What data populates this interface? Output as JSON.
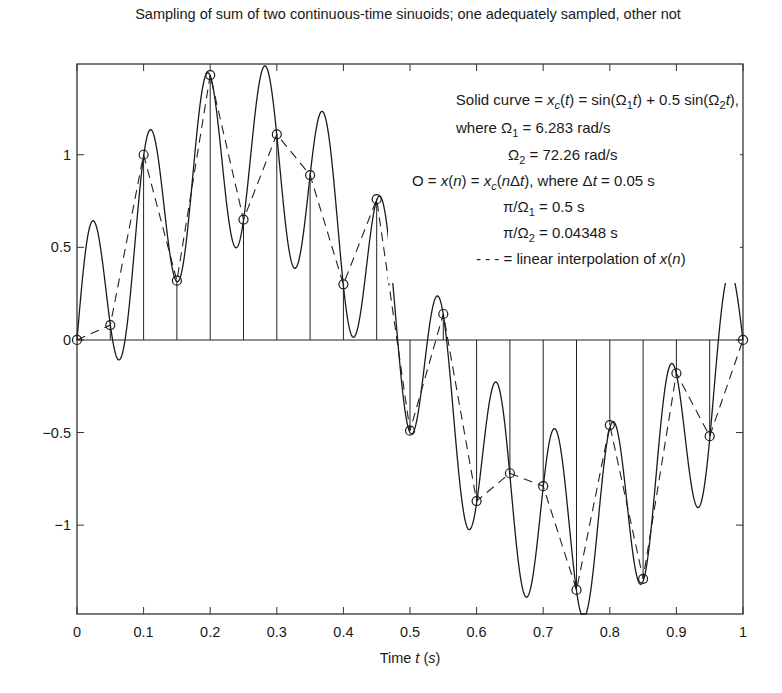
{
  "chart_data": {
    "type": "line",
    "title": "Sampling of sum of two continuous-time sinuoids; one adequately sampled, other not",
    "xlabel": "Time t (s)",
    "xlabel_parts": {
      "pre": "Time ",
      "var": "t",
      "paren_open": " (",
      "unit": "s",
      "paren_close": ")"
    },
    "ylabel": "",
    "xlim": [
      0,
      1
    ],
    "ylim": [
      -1.48,
      1.49
    ],
    "grid": false,
    "x_ticks": [
      0,
      0.1,
      0.2,
      0.3,
      0.4,
      0.5,
      0.6,
      0.7,
      0.8,
      0.9,
      1
    ],
    "x_tick_labels": [
      "0",
      "0.1",
      "0.2",
      "0.3",
      "0.4",
      "0.5",
      "0.6",
      "0.7",
      "0.8",
      "0.9",
      "1"
    ],
    "y_ticks": [
      -1,
      -0.5,
      0,
      0.5,
      1
    ],
    "y_tick_labels": [
      "−1",
      "−0.5",
      "0",
      "0.5",
      "1"
    ],
    "parameters": {
      "Omega1": 6.283,
      "Omega2": 72.26,
      "amplitude2": 0.5,
      "delta_t": 0.05
    },
    "series": [
      {
        "name": "Solid curve x_c(t) = sin(Ω1 t) + 0.5 sin(Ω2 t)",
        "style": "solid",
        "kind": "continuous"
      },
      {
        "name": "Samples x(n) = x_c(nΔt)",
        "style": "circle-markers-with-stems",
        "x": [
          0,
          0.05,
          0.1,
          0.15,
          0.2,
          0.25,
          0.3,
          0.35,
          0.4,
          0.45,
          0.5,
          0.55,
          0.6,
          0.65,
          0.7,
          0.75,
          0.8,
          0.85,
          0.9,
          0.95,
          1.0
        ],
        "values": [
          0.0,
          0.08,
          1.0,
          0.32,
          1.43,
          0.65,
          1.11,
          0.89,
          0.3,
          0.76,
          -0.49,
          0.14,
          -0.87,
          -0.72,
          -0.79,
          -1.35,
          -0.46,
          -1.29,
          -0.18,
          -0.52,
          0.0
        ]
      },
      {
        "name": "Linear interpolation of x(n)",
        "style": "dashed"
      }
    ],
    "legend": {
      "position": "upper-right (inside axes)",
      "lines": [
        "Solid curve = x_c(t) = sin(Ω_1 t) + 0.5 sin(Ω_2 t),",
        "where Ω_1 = 6.283 rad/s",
        "Ω_2 = 72.26 rad/s",
        "O = x(n) = x_c(nΔt), where Δt = 0.05 s",
        "π/Ω_1 = 0.5 s",
        "π/Ω_2 = 0.04348 s",
        "- - - = linear interpolation of x(n)"
      ]
    }
  },
  "annotations": {
    "l1": {
      "a": "Solid curve = ",
      "b": "x",
      "c": "c",
      "d": "(",
      "e": "t",
      "f": ") = sin(Ω",
      "g": "1",
      "h": "t",
      "i": ") + 0.5 sin(Ω",
      "j": "2",
      "k": "t",
      "l": "),"
    },
    "l2": {
      "a": "where Ω",
      "b": "1",
      "c": " = 6.283 rad/s"
    },
    "l3": {
      "a": "Ω",
      "b": "2",
      "c": " = 72.26 rad/s"
    },
    "l4": {
      "a": "O = ",
      "b": "x",
      "c": "(",
      "d": "n",
      "e": ") = ",
      "f": "x",
      "g": "c",
      "h": "(",
      "i": "n",
      "j": "Δ",
      "k": "t",
      "l": "), where Δ",
      "m": "t",
      "n": " = 0.05 s"
    },
    "l5": {
      "a": "π/Ω",
      "b": "1",
      "c": " = 0.5 s"
    },
    "l6": {
      "a": "π/Ω",
      "b": "2",
      "c": " = 0.04348 s"
    },
    "l7": {
      "a": "- - - = linear interpolation of ",
      "b": "x",
      "c": "(",
      "d": "n",
      "e": ")"
    }
  }
}
